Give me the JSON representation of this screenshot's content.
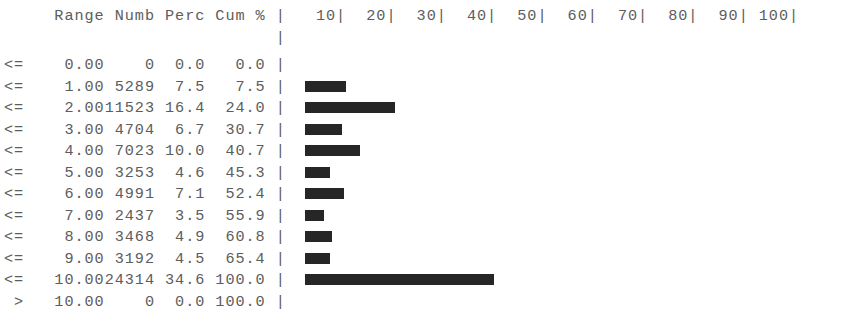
{
  "header": {
    "op_col": "",
    "range": "Range",
    "numb": "Numb",
    "perc": "Perc",
    "cum": "Cum %",
    "axis_line": "|   10|  20|  30|  40|  50|  60|  70|  80|  90| 100|"
  },
  "chart_data": {
    "type": "bar",
    "title": "",
    "xlabel": "",
    "ylabel": "",
    "orientation": "horizontal",
    "xlim": [
      0,
      100
    ],
    "grid": false,
    "legend": null,
    "axis_ticks": [
      10,
      20,
      30,
      40,
      50,
      60,
      70,
      80,
      90,
      100
    ],
    "axis_tick_labels": [
      "10",
      "20",
      "30",
      "40",
      "50",
      "60",
      "70",
      "80",
      "90",
      "100"
    ],
    "columns": [
      "op",
      "Range",
      "Numb",
      "Perc",
      "Cum %"
    ],
    "categories": [
      "0.00",
      "1.00",
      "2.00",
      "3.00",
      "4.00",
      "5.00",
      "6.00",
      "7.00",
      "8.00",
      "9.00",
      "10.00",
      "10.00"
    ],
    "values": [
      0.0,
      7.5,
      16.4,
      6.7,
      10.0,
      4.6,
      7.1,
      3.5,
      4.9,
      4.5,
      34.6,
      0.0
    ],
    "counts": [
      0,
      5289,
      11523,
      4704,
      7023,
      3253,
      4991,
      2437,
      3468,
      3192,
      24314,
      0
    ],
    "cumulative": [
      0.0,
      7.5,
      24.0,
      30.7,
      40.7,
      45.3,
      52.4,
      55.9,
      60.8,
      65.4,
      100.0,
      100.0
    ],
    "rows": [
      {
        "op": "<=",
        "range": "0.00",
        "numb": "0",
        "perc": "0.0",
        "cum": "0.0",
        "bar": 0.0
      },
      {
        "op": "<=",
        "range": "1.00",
        "numb": "5289",
        "perc": "7.5",
        "cum": "7.5",
        "bar": 7.5
      },
      {
        "op": "<=",
        "range": "2.00",
        "numb": "11523",
        "perc": "16.4",
        "cum": "24.0",
        "bar": 16.4
      },
      {
        "op": "<=",
        "range": "3.00",
        "numb": "4704",
        "perc": "6.7",
        "cum": "30.7",
        "bar": 6.7
      },
      {
        "op": "<=",
        "range": "4.00",
        "numb": "7023",
        "perc": "10.0",
        "cum": "40.7",
        "bar": 10.0
      },
      {
        "op": "<=",
        "range": "5.00",
        "numb": "3253",
        "perc": "4.6",
        "cum": "45.3",
        "bar": 4.6
      },
      {
        "op": "<=",
        "range": "6.00",
        "numb": "4991",
        "perc": "7.1",
        "cum": "52.4",
        "bar": 7.1
      },
      {
        "op": "<=",
        "range": "7.00",
        "numb": "2437",
        "perc": "3.5",
        "cum": "55.9",
        "bar": 3.5
      },
      {
        "op": "<=",
        "range": "8.00",
        "numb": "3468",
        "perc": "4.9",
        "cum": "60.8",
        "bar": 4.9
      },
      {
        "op": "<=",
        "range": "9.00",
        "numb": "3192",
        "perc": "4.5",
        "cum": "65.4",
        "bar": 4.5
      },
      {
        "op": "<=",
        "range": "10.00",
        "numb": "24314",
        "perc": "34.6",
        "cum": "100.0",
        "bar": 34.6
      },
      {
        "op": ">",
        "range": "10.00",
        "numb": "0",
        "perc": "0.0",
        "cum": "100.0",
        "bar": 0.0
      }
    ]
  },
  "style": {
    "text_color": "#5d5d5d",
    "bar_color": "#262626",
    "axis_color": "#6a6a6a",
    "background": "#ffffff"
  }
}
